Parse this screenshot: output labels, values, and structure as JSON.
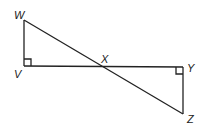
{
  "diagram": {
    "type": "geometry",
    "points": {
      "W": {
        "label": "W",
        "x": 24,
        "y": 20
      },
      "V": {
        "label": "V",
        "x": 24,
        "y": 66
      },
      "X": {
        "label": "X",
        "x": 104,
        "y": 67
      },
      "Y": {
        "label": "Y",
        "x": 183,
        "y": 67
      },
      "Z": {
        "label": "Z",
        "x": 183,
        "y": 114
      }
    },
    "segments": [
      "WV",
      "VY",
      "WZ",
      "YZ"
    ],
    "right_angles": [
      "V",
      "Y"
    ]
  }
}
